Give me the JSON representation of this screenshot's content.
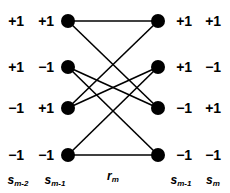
{
  "diagram": {
    "type": "trellis",
    "title": "",
    "node_radius": 7,
    "node_color": "#000000",
    "edge_color": "#000000",
    "edge_width": 1.6,
    "background": "#ffffff",
    "left_nodes": [
      {
        "id": "L1",
        "x": 68,
        "y": 21
      },
      {
        "id": "L2",
        "x": 68,
        "y": 67
      },
      {
        "id": "L3",
        "x": 68,
        "y": 108
      },
      {
        "id": "L4",
        "x": 68,
        "y": 155
      }
    ],
    "right_nodes": [
      {
        "id": "R1",
        "x": 158,
        "y": 21
      },
      {
        "id": "R2",
        "x": 158,
        "y": 67
      },
      {
        "id": "R3",
        "x": 158,
        "y": 108
      },
      {
        "id": "R4",
        "x": 158,
        "y": 155
      }
    ],
    "edges": [
      {
        "from": "L1",
        "to": "R1"
      },
      {
        "from": "L1",
        "to": "R3"
      },
      {
        "from": "L2",
        "to": "R3"
      },
      {
        "from": "L2",
        "to": "R4"
      },
      {
        "from": "L3",
        "to": "R1"
      },
      {
        "from": "L3",
        "to": "R2"
      },
      {
        "from": "L4",
        "to": "R2"
      },
      {
        "from": "L4",
        "to": "R4"
      }
    ],
    "left_col1_labels": [
      {
        "text": "+1",
        "x": 16,
        "y": 21
      },
      {
        "text": "+1",
        "x": 16,
        "y": 67
      },
      {
        "text": "−1",
        "x": 16,
        "y": 108
      },
      {
        "text": "−1",
        "x": 16,
        "y": 155
      }
    ],
    "left_col2_labels": [
      {
        "text": "+1",
        "x": 46,
        "y": 21
      },
      {
        "text": "−1",
        "x": 46,
        "y": 67
      },
      {
        "text": "+1",
        "x": 46,
        "y": 108
      },
      {
        "text": "−1",
        "x": 46,
        "y": 155
      }
    ],
    "right_col1_labels": [
      {
        "text": "+1",
        "x": 184,
        "y": 21
      },
      {
        "text": "+1",
        "x": 184,
        "y": 67
      },
      {
        "text": "−1",
        "x": 184,
        "y": 108
      },
      {
        "text": "−1",
        "x": 184,
        "y": 155
      }
    ],
    "right_col2_labels": [
      {
        "text": "+1",
        "x": 213,
        "y": 21
      },
      {
        "text": "−1",
        "x": 213,
        "y": 67
      },
      {
        "text": "+1",
        "x": 213,
        "y": 108
      },
      {
        "text": "−1",
        "x": 213,
        "y": 155
      }
    ],
    "axis_labels": {
      "left_outer": {
        "base": "s",
        "sub": "m-2",
        "x": 18,
        "y": 180
      },
      "left_inner": {
        "base": "s",
        "sub": "m-1",
        "x": 55,
        "y": 180
      },
      "center": {
        "base": "r",
        "sub": "m",
        "x": 113,
        "y": 176
      },
      "right_inner": {
        "base": "s",
        "sub": "m-1",
        "x": 181,
        "y": 180
      },
      "right_outer": {
        "base": "s",
        "sub": "m",
        "x": 213,
        "y": 180
      }
    }
  }
}
